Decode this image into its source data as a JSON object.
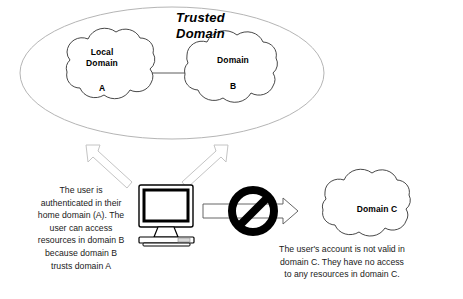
{
  "diagram": {
    "trusted_group": {
      "label_line1": "Trusted",
      "label_line2": "Domain",
      "shape": "ellipse-boundary"
    },
    "clouds": [
      {
        "id": "local-domain-a",
        "line1": "Local",
        "line2": "Domain",
        "line3": "A"
      },
      {
        "id": "domain-b",
        "line1": "Domain",
        "line2": "B"
      },
      {
        "id": "domain-c",
        "line1": "Domain C"
      }
    ],
    "icons": {
      "computer": "desktop-computer-icon",
      "blocked": "no-entry-prohibited-icon",
      "arrow_left": "arrow-up-left-icon",
      "arrow_right": "arrow-up-right-icon",
      "arrow_to_c": "arrow-right-icon"
    },
    "captions": {
      "left": [
        "The user is",
        "authenticated in their",
        "home domain (A).  The",
        "user can access",
        "resources in domain B",
        "because domain B",
        "trusts domain A"
      ],
      "right": [
        "The user's account is not  valid in",
        "domain C.  They have no access",
        "to any resources in domain C."
      ]
    },
    "colors": {
      "background": "#ffffff",
      "stroke": "#000000",
      "ellipse_stroke": "#b5b5b5",
      "arrow_stroke": "#c9c9c9",
      "blocked_fill": "#000000",
      "text": "#000000"
    }
  }
}
